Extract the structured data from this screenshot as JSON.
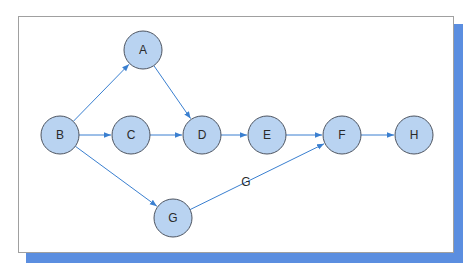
{
  "diagram": {
    "type": "directed-graph",
    "colors": {
      "node_fill": "#b9d3f1",
      "node_stroke": "#4d5460",
      "edge": "#3a7fd0",
      "frame_border": "#a0a0a0",
      "shadow": "#5b8ee0"
    },
    "nodes": [
      {
        "id": "A",
        "label": "A",
        "x": 143,
        "y": 50
      },
      {
        "id": "B",
        "label": "B",
        "x": 60,
        "y": 135
      },
      {
        "id": "C",
        "label": "C",
        "x": 131,
        "y": 135
      },
      {
        "id": "D",
        "label": "D",
        "x": 202,
        "y": 135
      },
      {
        "id": "E",
        "label": "E",
        "x": 267,
        "y": 135
      },
      {
        "id": "F",
        "label": "F",
        "x": 342,
        "y": 135
      },
      {
        "id": "H",
        "label": "H",
        "x": 414,
        "y": 135
      },
      {
        "id": "G",
        "label": "G",
        "x": 173,
        "y": 218
      }
    ],
    "edges": [
      {
        "from": "B",
        "to": "A",
        "label": ""
      },
      {
        "from": "A",
        "to": "D",
        "label": ""
      },
      {
        "from": "B",
        "to": "C",
        "label": ""
      },
      {
        "from": "C",
        "to": "D",
        "label": ""
      },
      {
        "from": "D",
        "to": "E",
        "label": ""
      },
      {
        "from": "E",
        "to": "F",
        "label": ""
      },
      {
        "from": "F",
        "to": "H",
        "label": ""
      },
      {
        "from": "B",
        "to": "G",
        "label": ""
      },
      {
        "from": "G",
        "to": "F",
        "label": "G"
      }
    ],
    "edge_label": {
      "text": "G",
      "x": 246,
      "y": 186
    }
  }
}
